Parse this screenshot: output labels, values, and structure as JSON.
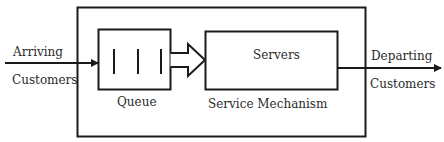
{
  "diagram": {
    "type": "queueing-system",
    "labels": {
      "arriving": "Arriving",
      "arriving_customers": "Customers",
      "queue": "Queue",
      "servers": "Servers",
      "service_mechanism": "Service Mechanism",
      "departing": "Departing",
      "departing_customers": "Customers"
    },
    "queue_bars": 3,
    "colors": {
      "stroke": "#1a1a1a",
      "text": "#2a2a2a",
      "background": "#ffffff"
    }
  }
}
